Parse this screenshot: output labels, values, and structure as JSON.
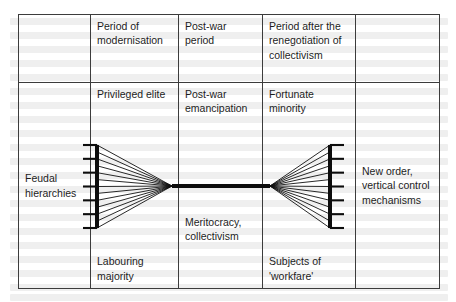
{
  "figure": {
    "kind": "table-with-hourglass-diagram",
    "ink_color": "#1d1d1d",
    "border_color": "#3c3c3c",
    "columns": 5,
    "rows": 2
  },
  "header_row": {
    "col1": "",
    "col2": "Period of modernisation",
    "col3": "Post-war period",
    "col4": "Period after the renegotiation of collectivism",
    "col5": ""
  },
  "body_row": {
    "col1_middle": "Feudal hierarchies",
    "col2_top": "Privileged elite",
    "col2_bottom": "Labouring majority",
    "col3_top": "Post-war emancipation",
    "col3_middle": "Meritocracy, collectivism",
    "col4_top": "Fortunate minority",
    "col4_bottom": "Subjects of 'workfare'",
    "col5_middle": "New order, vertical control mechanisms"
  },
  "diagram": {
    "left_bar_ticks": 7,
    "right_bar_ticks": 7,
    "fan_lines_per_side": 12,
    "left_bar_x": 97,
    "right_bar_x": 330,
    "bar_top_y": 145,
    "bar_bottom_y": 228,
    "left_apex_x": 172,
    "right_apex_x": 270,
    "waist_y": 186,
    "waist_thickness": 4,
    "tick_length": 14,
    "bar_thickness": 4
  }
}
